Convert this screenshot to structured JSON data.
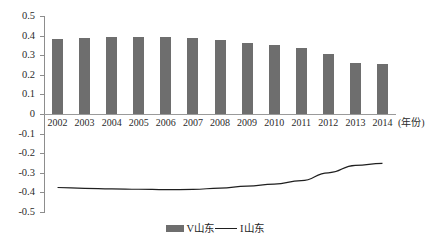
{
  "chart_data": {
    "type": "bar",
    "title": "",
    "subtitle": "",
    "xlabel": "(年份)",
    "ylabel": "",
    "categories": [
      "2002",
      "2003",
      "2004",
      "2005",
      "2006",
      "2007",
      "2008",
      "2009",
      "2010",
      "2011",
      "2012",
      "2013",
      "2014"
    ],
    "ylim": [
      -0.5,
      0.5
    ],
    "ytick_labels": [
      "0.5",
      "0.4",
      "0.3",
      "0.2",
      "0.1",
      "0",
      "-0.1",
      "-0.2",
      "-0.3",
      "-0.4",
      "-0.5"
    ],
    "ytick_values": [
      0.5,
      0.4,
      0.3,
      0.2,
      0.1,
      0,
      -0.1,
      -0.2,
      -0.3,
      -0.4,
      -0.5
    ],
    "grid": false,
    "legend_position": "bottom",
    "series": [
      {
        "name": "V山东",
        "type": "bar",
        "color": "#6e6e6e",
        "values": [
          0.385,
          0.388,
          0.392,
          0.393,
          0.392,
          0.388,
          0.378,
          0.363,
          0.352,
          0.338,
          0.305,
          0.262,
          0.253
        ]
      },
      {
        "name": "I山东",
        "type": "line",
        "color": "#1f1f1f",
        "values": [
          -0.375,
          -0.379,
          -0.382,
          -0.384,
          -0.386,
          -0.385,
          -0.378,
          -0.368,
          -0.358,
          -0.34,
          -0.3,
          -0.262,
          -0.252
        ]
      }
    ]
  },
  "legend": {
    "items": [
      {
        "label": "V山东",
        "swatch": "bar-swatch"
      },
      {
        "label": "I山东",
        "swatch": "line-swatch"
      }
    ]
  },
  "axis": {
    "x_axis_name": "(年份)"
  }
}
